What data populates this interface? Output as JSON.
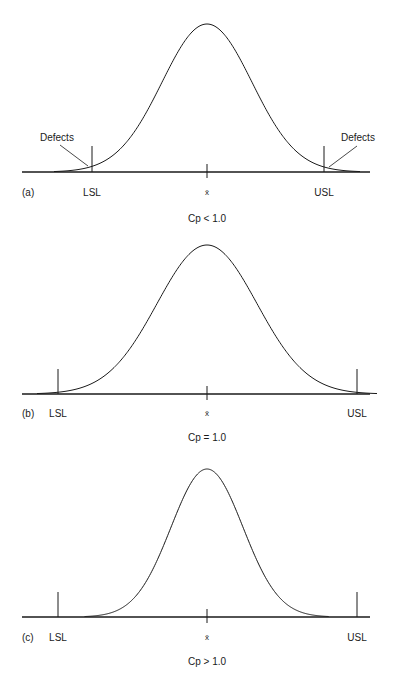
{
  "figure": {
    "panels": [
      {
        "id": "a",
        "panel_label": "(a)",
        "lsl_label": "LSL",
        "usl_label": "USL",
        "mean_label": "x̄",
        "caption": "Cp < 1.0",
        "left_annotation": "Defects",
        "right_annotation": "Defects",
        "geometry": {
          "baseline_y": 172,
          "peak_y": 24,
          "mean_x": 207,
          "sigma_px": 45,
          "lsl_x": 92,
          "usl_x": 324,
          "spec_tick_top": 146,
          "x_start": 22,
          "x_end": 370
        }
      },
      {
        "id": "b",
        "panel_label": "(b)",
        "lsl_label": "LSL",
        "usl_label": "USL",
        "mean_label": "x̄",
        "caption": "Cp = 1.0",
        "geometry": {
          "baseline_y": 394,
          "peak_y": 245,
          "mean_x": 207,
          "sigma_px": 50,
          "lsl_x": 58,
          "usl_x": 357,
          "spec_tick_top": 369,
          "x_start": 22,
          "x_end": 370
        }
      },
      {
        "id": "c",
        "panel_label": "(c)",
        "lsl_label": "LSL",
        "usl_label": "USL",
        "mean_label": "x̄",
        "caption": "Cp > 1.0",
        "geometry": {
          "baseline_y": 617,
          "peak_y": 469,
          "mean_x": 207,
          "sigma_px": 36,
          "lsl_x": 58,
          "usl_x": 357,
          "spec_tick_top": 592,
          "x_start": 22,
          "x_end": 370
        }
      }
    ]
  },
  "colors": {
    "ink": "#1a1a1a",
    "background": "#ffffff"
  }
}
